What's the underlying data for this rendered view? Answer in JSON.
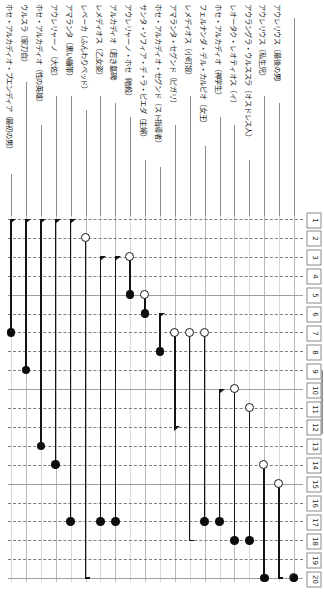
{
  "chart_data": {
    "type": "scatter",
    "title": "",
    "xlabel": "",
    "ylabel": "",
    "ylim": [
      1,
      20
    ],
    "grid": true,
    "legend_position": "none",
    "orientation": "vertical-columns-rotated-labels",
    "rank_axis_labels": [
      "1",
      "2",
      "3",
      "4",
      "5",
      "6",
      "7",
      "8",
      "9",
      "10",
      "11",
      "12",
      "13",
      "14",
      "15",
      "16",
      "17",
      "18",
      "19",
      "20"
    ],
    "categories": [
      "アウレリウス（最後の男）",
      "アウレリウス（私生児）",
      "アウラングラ・ウルススラ（オスドレス人）",
      "レオータク・レオティオス（イ）",
      "ホセ・アルカディオ（神学生）",
      "フェルナンダ・デル・カルピオ（女王）",
      "レメディオス（小町娘）",
      "アマランタ・セグンド（ピガリ）",
      "ホセ・アルカディオ・セグンド（スト指導者）",
      "サンタ・ソフィア・デ・ラ・ピエダ（主婦）",
      "アウレリャーノ・ホセ（暗殺）",
      "アルカディオ（若き墓碑）",
      "レメディオス（乙女姿）",
      "レベーカ（ふんわりベッド）",
      "アマランタ（黒い繃帯）",
      "アウレリャーノ（大佐）",
      "ホセ・アルカディオ（性の英雄）",
      "ウルスラ（家刀自）",
      "ホセ・アルカディオ・ブエンディア（最初の男）"
    ],
    "series": [
      {
        "name": "開始順位",
        "marker": "open-circle",
        "values": [
          20,
          15,
          14,
          11,
          10,
          null,
          null,
          null,
          null,
          7,
          7,
          7,
          5,
          3,
          2,
          null,
          null,
          null,
          null
        ]
      },
      {
        "name": "終了順位",
        "marker": "filled-circle",
        "values": [
          20,
          20,
          18,
          18,
          17,
          17,
          18,
          17,
          17,
          8,
          6,
          5,
          9,
          14,
          13,
          7,
          null,
          null,
          null
        ]
      }
    ],
    "points": [
      {
        "col": 0,
        "start_rank": 20,
        "start_marker": "open-circle",
        "end_rank": 20,
        "end_marker": "filled-circle"
      },
      {
        "col": 1,
        "start_rank": 15,
        "start_marker": "open-circle",
        "end_rank": 20,
        "end_marker": "tick-foot"
      },
      {
        "col": 2,
        "start_rank": 14,
        "start_marker": "open-circle",
        "end_rank": 20,
        "end_marker": "filled-circle"
      },
      {
        "col": 3,
        "start_rank": 11,
        "start_marker": "open-circle",
        "end_rank": 18,
        "end_marker": "filled-circle"
      },
      {
        "col": 4,
        "start_rank": 10,
        "start_marker": "open-circle",
        "end_rank": 18,
        "end_marker": "filled-circle"
      },
      {
        "col": 5,
        "start_rank": 10,
        "start_marker": "arrow-head",
        "end_rank": 17,
        "end_marker": "filled-circle"
      },
      {
        "col": 6,
        "start_rank": 7,
        "start_marker": "open-circle",
        "end_rank": 17,
        "end_marker": "filled-circle"
      },
      {
        "col": 7,
        "start_rank": 7,
        "start_marker": "open-circle",
        "end_rank": 18,
        "end_marker": "tick-foot"
      },
      {
        "col": 8,
        "start_rank": 7,
        "start_marker": "open-circle",
        "end_rank": 12,
        "end_marker": "arrow-head"
      },
      {
        "col": 9,
        "start_rank": 6,
        "start_marker": "arrow-head",
        "end_rank": 8,
        "end_marker": "filled-circle"
      },
      {
        "col": 10,
        "start_rank": 5,
        "start_marker": "open-circle",
        "end_rank": 6,
        "end_marker": "filled-circle"
      },
      {
        "col": 11,
        "start_rank": 3,
        "start_marker": "open-circle",
        "end_rank": 5,
        "end_marker": "filled-circle"
      },
      {
        "col": 12,
        "start_rank": 3,
        "start_marker": "arrow-head",
        "end_rank": 17,
        "end_marker": "filled-circle"
      },
      {
        "col": 13,
        "start_rank": 3,
        "start_marker": "arrow-head",
        "end_rank": 17,
        "end_marker": "filled-circle"
      },
      {
        "col": 14,
        "start_rank": 2,
        "start_marker": "open-circle",
        "end_rank": 20,
        "end_marker": "tick-foot"
      },
      {
        "col": 15,
        "start_rank": 1,
        "start_marker": "arrow-head",
        "end_rank": 17,
        "end_marker": "filled-circle"
      },
      {
        "col": 16,
        "start_rank": 1,
        "start_marker": "arrow-head",
        "end_rank": 14,
        "end_marker": "filled-circle"
      },
      {
        "col": 17,
        "start_rank": 1,
        "start_marker": "arrow-head",
        "end_rank": 13,
        "end_marker": "filled-circle"
      },
      {
        "col": 18,
        "start_rank": 1,
        "start_marker": "arrow-head",
        "end_rank": 9,
        "end_marker": "filled-circle"
      },
      {
        "col": 19,
        "start_rank": 1,
        "start_marker": "arrow-head",
        "end_rank": 7,
        "end_marker": "filled-circle"
      }
    ],
    "colors": {
      "stem": "#0d0d0d",
      "open_marker_fill": "#ffffff",
      "open_marker_stroke": "#1a1a1a",
      "filled_marker": "#0d0d0d",
      "grid_dashed": "#7d7d7d",
      "grid_solid": "#9e9e9e",
      "column_grid": "#b9b9b9",
      "label_text": "#1a1a1a"
    }
  }
}
